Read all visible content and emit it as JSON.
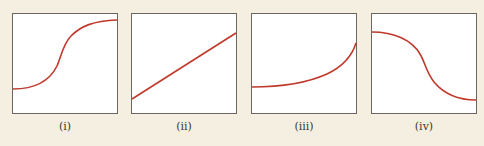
{
  "figure": {
    "background": "#f5efe1",
    "curve_color": "#c0392b",
    "panels": [
      {
        "label": "(i)",
        "shape": "s-curve increasing (sigmoid)"
      },
      {
        "label": "(ii)",
        "shape": "straight line increasing"
      },
      {
        "label": "(iii)",
        "shape": "convex increasing (exponential-like)"
      },
      {
        "label": "(iv)",
        "shape": "s-curve decreasing (reverse sigmoid)"
      }
    ]
  }
}
